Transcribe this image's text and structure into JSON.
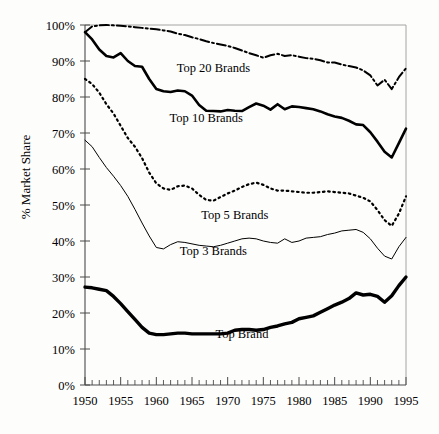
{
  "chart_data": {
    "type": "line",
    "title": "",
    "xlabel": "",
    "ylabel": "% Market Share",
    "xlim": [
      1950,
      1995
    ],
    "ylim": [
      0,
      100
    ],
    "grid": false,
    "legend_position": "inline-annotations",
    "x_tick_labels": [
      "1950",
      "1955",
      "1960",
      "1965",
      "1970",
      "1975",
      "1980",
      "1985",
      "1990",
      "1995"
    ],
    "x_ticks": [
      1950,
      1955,
      1960,
      1965,
      1970,
      1975,
      1980,
      1985,
      1990,
      1995
    ],
    "y_tick_labels": [
      "0%",
      "10%",
      "20%",
      "30%",
      "40%",
      "50%",
      "60%",
      "70%",
      "80%",
      "90%",
      "100%"
    ],
    "y_ticks": [
      0,
      10,
      20,
      30,
      40,
      50,
      60,
      70,
      80,
      90,
      100
    ],
    "x": [
      1950,
      1951,
      1952,
      1953,
      1954,
      1955,
      1956,
      1957,
      1958,
      1959,
      1960,
      1961,
      1962,
      1963,
      1964,
      1965,
      1966,
      1967,
      1968,
      1969,
      1970,
      1971,
      1972,
      1973,
      1974,
      1975,
      1976,
      1977,
      1978,
      1979,
      1980,
      1981,
      1982,
      1983,
      1984,
      1985,
      1986,
      1987,
      1988,
      1989,
      1990,
      1991,
      1992,
      1993,
      1994,
      1995
    ],
    "series": [
      {
        "name": "Top 20 Brands",
        "style": "dash-dot",
        "stroke_width": 2.0,
        "label_x": 1968,
        "label_y": 87,
        "values": [
          98.0,
          99.6,
          99.9,
          100.0,
          99.9,
          99.8,
          99.6,
          99.4,
          99.2,
          99.0,
          98.8,
          98.5,
          98.2,
          97.6,
          97.2,
          96.6,
          96.1,
          95.5,
          95.0,
          94.6,
          94.2,
          93.6,
          92.9,
          92.2,
          91.6,
          90.9,
          91.6,
          92.0,
          91.4,
          91.6,
          91.2,
          90.8,
          90.6,
          90.2,
          89.6,
          89.6,
          89.0,
          88.6,
          88.2,
          87.4,
          86.0,
          83.2,
          84.8,
          82.2,
          85.5,
          88.0
        ]
      },
      {
        "name": "Top 10 Brands",
        "style": "solid-thick",
        "stroke_width": 2.6,
        "label_x": 1967,
        "label_y": 73,
        "values": [
          98.0,
          96.0,
          93.2,
          91.4,
          91.0,
          92.2,
          90.0,
          88.6,
          88.4,
          85.0,
          82.2,
          81.6,
          81.4,
          81.8,
          81.6,
          80.4,
          77.8,
          76.2,
          76.1,
          76.0,
          76.4,
          76.2,
          76.1,
          77.2,
          78.2,
          77.6,
          76.5,
          78.0,
          76.6,
          77.4,
          77.2,
          76.9,
          76.6,
          76.0,
          75.2,
          74.6,
          74.2,
          73.4,
          72.4,
          72.2,
          70.2,
          67.6,
          64.8,
          63.2,
          67.2,
          71.2
        ]
      },
      {
        "name": "Top 5 Brands",
        "style": "dotted",
        "stroke_width": 2.2,
        "label_x": 1971,
        "label_y": 46,
        "values": [
          85.0,
          83.6,
          81.2,
          78.0,
          75.4,
          72.0,
          68.6,
          66.2,
          63.0,
          59.0,
          56.0,
          54.6,
          54.2,
          55.2,
          55.4,
          54.6,
          52.8,
          51.4,
          51.2,
          52.2,
          53.2,
          54.0,
          55.0,
          55.8,
          56.2,
          55.6,
          54.6,
          54.0,
          54.0,
          53.8,
          53.6,
          53.4,
          53.4,
          53.6,
          53.8,
          53.6,
          53.4,
          53.2,
          52.6,
          52.0,
          51.0,
          48.6,
          45.8,
          44.2,
          47.6,
          52.4
        ]
      },
      {
        "name": "Top 3 Brands",
        "style": "solid-thin",
        "stroke_width": 1.0,
        "label_x": 1968,
        "label_y": 36,
        "values": [
          68.0,
          66.2,
          63.2,
          60.4,
          58.0,
          55.4,
          52.4,
          48.8,
          45.0,
          41.4,
          38.2,
          37.8,
          39.0,
          39.8,
          39.6,
          39.2,
          38.8,
          38.6,
          38.4,
          38.8,
          39.4,
          40.0,
          40.6,
          40.8,
          40.6,
          40.0,
          39.6,
          39.4,
          40.6,
          39.6,
          40.0,
          40.8,
          41.0,
          41.2,
          41.8,
          42.2,
          42.8,
          43.0,
          43.2,
          42.4,
          40.6,
          38.0,
          35.8,
          35.0,
          38.4,
          41.0
        ]
      },
      {
        "name": "Top Brand",
        "style": "solid-extra-thick",
        "stroke_width": 3.4,
        "label_x": 1972,
        "label_y": 13,
        "values": [
          27.2,
          27.0,
          26.6,
          26.2,
          24.6,
          22.6,
          20.4,
          18.2,
          16.0,
          14.4,
          14.0,
          14.0,
          14.2,
          14.4,
          14.4,
          14.2,
          14.2,
          14.2,
          14.2,
          14.2,
          14.4,
          15.2,
          15.4,
          15.4,
          15.2,
          15.4,
          16.0,
          16.4,
          17.0,
          17.4,
          18.4,
          18.8,
          19.2,
          20.2,
          21.2,
          22.2,
          23.0,
          24.0,
          25.6,
          25.0,
          25.2,
          24.6,
          23.0,
          24.8,
          27.6,
          30.0
        ]
      }
    ]
  }
}
